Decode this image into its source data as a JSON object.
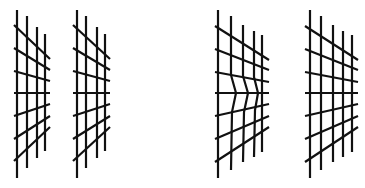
{
  "figure": {
    "stroke_color": "#111111",
    "background": "#ffffff",
    "caption_visible": "cut off at bottom edge",
    "grids": [
      {
        "id": "grid-1",
        "verticals": [
          [
            17,
            10,
            178
          ],
          [
            27,
            16,
            168
          ],
          [
            37,
            27,
            158
          ],
          [
            45,
            34,
            151
          ]
        ],
        "horizontals": [
          [
            14,
            25,
            50,
            59
          ],
          [
            14,
            48,
            50,
            70
          ],
          [
            14,
            71,
            50,
            81
          ],
          [
            14,
            93,
            50,
            93
          ],
          [
            14,
            116,
            50,
            104
          ],
          [
            14,
            139,
            50,
            116
          ],
          [
            14,
            161,
            50,
            127
          ]
        ]
      },
      {
        "id": "grid-2",
        "verticals": [
          [
            77,
            10,
            178
          ],
          [
            86,
            16,
            168
          ],
          [
            97,
            27,
            158
          ],
          [
            105,
            34,
            151
          ]
        ],
        "horizontals": [
          [
            73,
            25,
            110,
            59
          ],
          [
            73,
            48,
            110,
            70
          ],
          [
            73,
            71,
            110,
            81
          ],
          [
            73,
            93,
            110,
            93
          ],
          [
            73,
            116,
            110,
            104
          ],
          [
            73,
            139,
            110,
            116
          ],
          [
            73,
            161,
            110,
            127
          ]
        ]
      },
      {
        "id": "grid-3-distorted",
        "verticals_path": [
          "M218,10 L218,178",
          "M231,16 L231,75 L236,93 L232,112 L231,170",
          "M243,25 L243,76 L248,93 L244,112 L243,162",
          "M254,31 L254,77 L258,93 L255,110 L254,157",
          "M262,35 L262,152"
        ],
        "horizontals": [
          [
            215,
            26,
            269,
            60
          ],
          [
            215,
            49,
            269,
            70
          ],
          [
            215,
            72,
            269,
            82
          ],
          [
            215,
            93,
            269,
            93
          ],
          [
            215,
            116,
            269,
            104
          ],
          [
            215,
            139,
            269,
            116
          ],
          [
            215,
            162,
            269,
            127
          ]
        ]
      },
      {
        "id": "grid-4",
        "verticals": [
          [
            310,
            10,
            178
          ],
          [
            321,
            16,
            170
          ],
          [
            333,
            25,
            162
          ],
          [
            343,
            31,
            157
          ],
          [
            352,
            35,
            152
          ]
        ],
        "horizontals": [
          [
            305,
            26,
            358,
            60
          ],
          [
            305,
            49,
            358,
            70
          ],
          [
            305,
            72,
            358,
            82
          ],
          [
            305,
            93,
            358,
            93
          ],
          [
            305,
            116,
            358,
            104
          ],
          [
            305,
            139,
            358,
            116
          ],
          [
            305,
            162,
            358,
            127
          ]
        ]
      }
    ]
  }
}
